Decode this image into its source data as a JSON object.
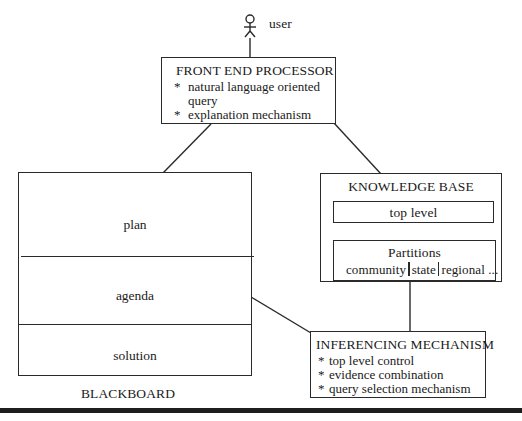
{
  "user": {
    "icon": "stick-figure-icon",
    "label": "user"
  },
  "front_end_processor": {
    "title": "FRONT  END PROCESSOR",
    "items": [
      {
        "bullet": "*",
        "text": "natural language oriented"
      },
      {
        "bullet": "",
        "text": "query"
      },
      {
        "bullet": "*",
        "text": "explanation mechanism"
      }
    ]
  },
  "blackboard": {
    "label": "BLACKBOARD",
    "sections": [
      "plan",
      "agenda",
      "solution"
    ]
  },
  "knowledge_base": {
    "title": "KNOWLEDGE BASE",
    "top_level": "top level",
    "partitions": {
      "title": "Partitions",
      "items": [
        "community",
        "state",
        "regional ..."
      ]
    }
  },
  "inferencing_mechanism": {
    "title": "INFERENCING MECHANISM",
    "items": [
      {
        "bullet": "*",
        "text": "top level control"
      },
      {
        "bullet": "*",
        "text": "evidence combination"
      },
      {
        "bullet": "*",
        "text": "query selection mechanism"
      }
    ]
  }
}
